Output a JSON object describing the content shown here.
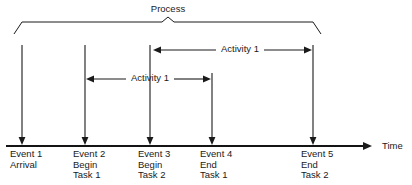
{
  "diagram": {
    "background_color": "#ffffff",
    "line_color": "#1a1a1a",
    "axis": {
      "label": "Time",
      "label_x": 382,
      "label_y": 149,
      "y": 146,
      "x_start": 6,
      "x_end": 372
    },
    "process_bracket": {
      "label": "Process",
      "label_x": 168,
      "label_y": 12,
      "left_x": 14,
      "left_top_x": 22,
      "right_x": 321,
      "right_top_x": 313,
      "top_y": 22,
      "foot_y": 34,
      "peak_x": 168,
      "peak_y": 17
    },
    "events": [
      {
        "id": "event-1",
        "x": 22,
        "line_top": 45,
        "lines": [
          "Event 1",
          "Arrival"
        ]
      },
      {
        "id": "event-2",
        "x": 85,
        "line_top": 45,
        "lines": [
          "Event 2",
          "Begin",
          "Task 1"
        ]
      },
      {
        "id": "event-3",
        "x": 150,
        "line_top": 45,
        "lines": [
          "Event 3",
          "Begin",
          "Task 2"
        ]
      },
      {
        "id": "event-4",
        "x": 212,
        "line_top": 73,
        "lines": [
          "Event 4",
          "End",
          "Task 1"
        ]
      },
      {
        "id": "event-5",
        "x": 313,
        "line_top": 45,
        "lines": [
          "Event 5",
          "End",
          "Task 2"
        ]
      }
    ],
    "label_first_line_y": 157,
    "label_line_height": 10.5,
    "label_offset_x": -12,
    "activity_spans": [
      {
        "id": "activity-span-upper",
        "label": "Activity 1",
        "x_left": 152,
        "x_right": 313,
        "y": 50,
        "label_x": 240,
        "label_y": 52,
        "label_half_width": 24
      },
      {
        "id": "activity-span-lower",
        "label": "Activity 1",
        "x_left": 85,
        "x_right": 212,
        "y": 79,
        "label_x": 150,
        "label_y": 81,
        "label_half_width": 24
      }
    ]
  }
}
